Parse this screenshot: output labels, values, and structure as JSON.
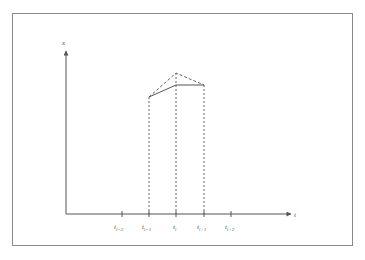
{
  "figure": {
    "axes": {
      "y_label": "x",
      "x_label": "t"
    },
    "ticks": [
      {
        "label": "t",
        "sub": "i−2"
      },
      {
        "label": "t",
        "sub": "i−1"
      },
      {
        "label": "t",
        "sub": "i"
      },
      {
        "label": "t",
        "sub": "i+1"
      },
      {
        "label": "t",
        "sub": "i+2"
      }
    ],
    "colors": {
      "frame": "#8a8a8a",
      "axis": "#555555",
      "line": "#555555"
    }
  }
}
